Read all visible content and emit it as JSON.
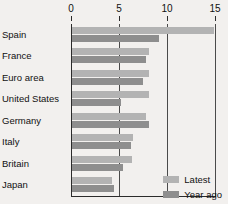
{
  "chart_data": {
    "type": "bar",
    "orientation": "horizontal",
    "title": "",
    "xlabel": "",
    "ylabel": "",
    "xlim": [
      0,
      15
    ],
    "xticks": [
      0,
      5,
      10,
      15
    ],
    "xtick_labels": [
      "0",
      "5",
      "10",
      "15"
    ],
    "grid": true,
    "grid_axis": "x",
    "legend_position": "bottom-right",
    "categories": [
      "Spain",
      "France",
      "Euro area",
      "United States",
      "Germany",
      "Italy",
      "Britain",
      "Japan"
    ],
    "series": [
      {
        "name": "Latest",
        "color": "#b3b3b3",
        "values": [
          14.8,
          8.0,
          8.0,
          8.0,
          7.7,
          6.4,
          6.2,
          4.2
        ]
      },
      {
        "name": "Year ago",
        "color": "#8e8e8e",
        "values": [
          9.1,
          7.7,
          7.4,
          5.1,
          8.0,
          6.1,
          5.3,
          4.4
        ]
      }
    ]
  },
  "legend": {
    "items": [
      {
        "label": "Latest",
        "color": "#b3b3b3"
      },
      {
        "label": "Year ago",
        "color": "#8e8e8e"
      }
    ]
  },
  "colors": {
    "background": "#f2f0ee",
    "axis": "#2b2b2b",
    "grid": "#4a4a4a",
    "text": "#111111"
  }
}
